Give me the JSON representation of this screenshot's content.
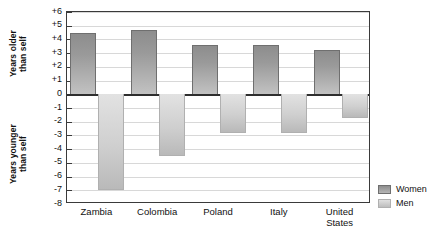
{
  "chart_data": {
    "type": "bar",
    "title": "",
    "subtitle": "",
    "xlabel": "",
    "ylabel": "",
    "categories": [
      "Zambia",
      "Colombia",
      "Poland",
      "Italy",
      "United\nStates"
    ],
    "series": [
      {
        "name": "Women",
        "color": "#8d8d8d",
        "values": [
          4.5,
          4.7,
          3.6,
          3.6,
          3.2
        ]
      },
      {
        "name": "Men",
        "color": "#cfcfcf",
        "values": [
          -7.0,
          -4.5,
          -2.8,
          -2.8,
          -1.7
        ]
      }
    ],
    "ylim": [
      -8,
      6
    ],
    "ytick_labels": [
      "+6",
      "+5",
      "+4",
      "+3",
      "+2",
      "+1",
      "0",
      "-1",
      "-2",
      "-3",
      "-4",
      "-5",
      "-6",
      "-7",
      "-8"
    ],
    "ytick_values": [
      6,
      5,
      4,
      3,
      2,
      1,
      0,
      -1,
      -2,
      -3,
      -4,
      -5,
      -6,
      -7,
      -8
    ],
    "grid": true,
    "legend_position": "right-bottom",
    "axis_captions": {
      "positive": "Years older\nthan self",
      "negative": "Years younger\nthan self"
    }
  }
}
